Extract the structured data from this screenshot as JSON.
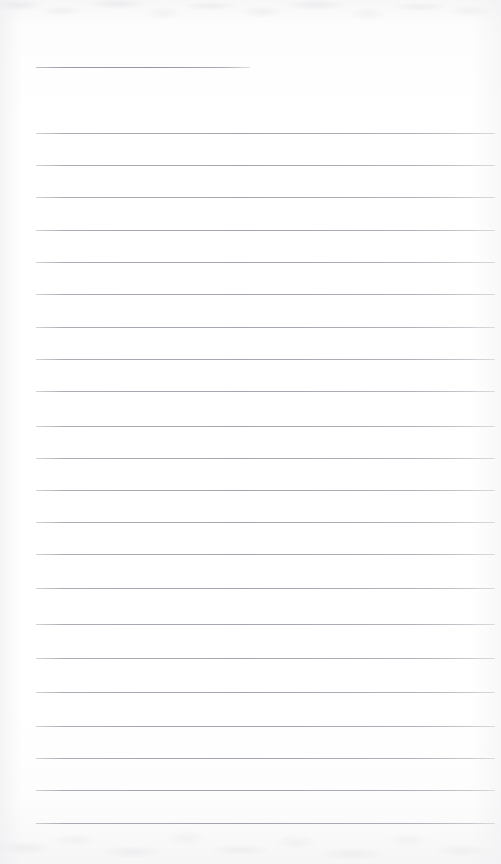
{
  "document": {
    "kind": "scanned-lined-paper",
    "title": "Blank ruled notebook page",
    "page_width": 501,
    "page_height": 864,
    "content_text": "",
    "notes": "No handwriting, printed text, or markings are present on the sheet."
  },
  "appearance": {
    "background_color": "#fdfdfd",
    "rule_color": "#9a9ca6",
    "rule_thickness": 1,
    "paper_tint": "#f7f7f8"
  },
  "ruling": {
    "left_margin_x": 36,
    "right_margin_x": 495,
    "line_spacing": 32.3,
    "short_rule_right_x": 250,
    "total_rules": 23,
    "rules": [
      {
        "y": 67,
        "x1": 36,
        "x2": 250,
        "style": "short"
      },
      {
        "y": 133,
        "x1": 36,
        "x2": 495,
        "style": "full"
      },
      {
        "y": 165,
        "x1": 36,
        "x2": 495,
        "style": "full"
      },
      {
        "y": 197,
        "x1": 36,
        "x2": 495,
        "style": "full"
      },
      {
        "y": 230,
        "x1": 36,
        "x2": 495,
        "style": "full"
      },
      {
        "y": 262,
        "x1": 36,
        "x2": 495,
        "style": "full"
      },
      {
        "y": 294,
        "x1": 36,
        "x2": 495,
        "style": "full"
      },
      {
        "y": 327,
        "x1": 36,
        "x2": 495,
        "style": "full"
      },
      {
        "y": 359,
        "x1": 36,
        "x2": 495,
        "style": "full"
      },
      {
        "y": 391,
        "x1": 36,
        "x2": 495,
        "style": "full"
      },
      {
        "y": 426,
        "x1": 36,
        "x2": 495,
        "style": "full"
      },
      {
        "y": 458,
        "x1": 36,
        "x2": 495,
        "style": "full"
      },
      {
        "y": 490,
        "x1": 36,
        "x2": 495,
        "style": "full"
      },
      {
        "y": 522,
        "x1": 36,
        "x2": 495,
        "style": "full"
      },
      {
        "y": 554,
        "x1": 36,
        "x2": 495,
        "style": "full"
      },
      {
        "y": 588,
        "x1": 36,
        "x2": 495,
        "style": "full"
      },
      {
        "y": 624,
        "x1": 36,
        "x2": 495,
        "style": "full"
      },
      {
        "y": 658,
        "x1": 36,
        "x2": 495,
        "style": "full"
      },
      {
        "y": 692,
        "x1": 36,
        "x2": 495,
        "style": "full"
      },
      {
        "y": 726,
        "x1": 36,
        "x2": 495,
        "style": "full"
      },
      {
        "y": 758,
        "x1": 36,
        "x2": 495,
        "style": "full"
      },
      {
        "y": 790,
        "x1": 36,
        "x2": 495,
        "style": "full"
      },
      {
        "y": 823,
        "x1": 36,
        "x2": 495,
        "style": "full"
      }
    ]
  }
}
